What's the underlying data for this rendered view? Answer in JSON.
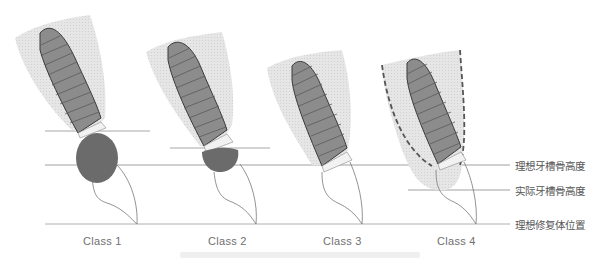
{
  "diagram": {
    "classes": [
      {
        "label": "Class 1",
        "defect": "large-circular-defect"
      },
      {
        "label": "Class 2",
        "defect": "small-half-defect"
      },
      {
        "label": "Class 3",
        "defect": "none"
      },
      {
        "label": "Class 4",
        "defect": "bone-resorbed-dashed-outline"
      }
    ],
    "legend": {
      "ideal_bone_height": "理想牙槽骨高度",
      "actual_bone_height": "实际牙槽骨高度",
      "ideal_restoration_position": "理想修复体位置"
    },
    "colors": {
      "bone_fill": "#e4e4e4",
      "implant_fill": "#8a8a8a",
      "defect_fill": "#6b6b6b",
      "line": "#9a9a9a",
      "outline": "#444444"
    }
  }
}
